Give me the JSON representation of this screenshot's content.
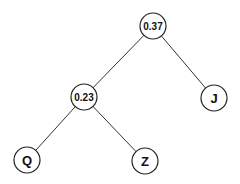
{
  "diagram": {
    "type": "binary-tree",
    "nodes": [
      {
        "id": "root",
        "label": "0.37",
        "x": 153,
        "y": 26,
        "kind": "internal"
      },
      {
        "id": "n1",
        "label": "0.23",
        "x": 84,
        "y": 97,
        "kind": "internal"
      },
      {
        "id": "J",
        "label": "J",
        "x": 214,
        "y": 98,
        "kind": "leaf"
      },
      {
        "id": "Q",
        "label": "Q",
        "x": 27,
        "y": 160,
        "kind": "leaf"
      },
      {
        "id": "Z",
        "label": "Z",
        "x": 145,
        "y": 161,
        "kind": "leaf"
      }
    ],
    "edges": [
      {
        "from": "root",
        "to": "n1"
      },
      {
        "from": "root",
        "to": "J"
      },
      {
        "from": "n1",
        "to": "Q"
      },
      {
        "from": "n1",
        "to": "Z"
      }
    ],
    "node_radius": 13
  }
}
